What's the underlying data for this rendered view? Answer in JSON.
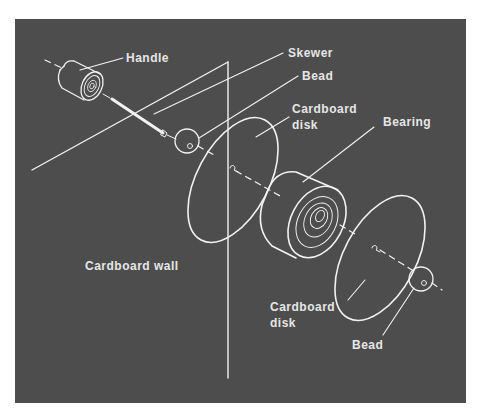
{
  "diagram": {
    "type": "exploded-assembly-illustration",
    "background_color": "#4d4d4d",
    "line_color": "#f2f2f2",
    "text_color": "#e6e6e6",
    "labels": {
      "handle": "Handle",
      "skewer": "Skewer",
      "bead_top": "Bead",
      "disk_top_line1": "Cardboard",
      "disk_top_line2": "disk",
      "bearing": "Bearing",
      "wall": "Cardboard wall",
      "disk_bottom_line1": "Cardboard",
      "disk_bottom_line2": "disk",
      "bead_bottom": "Bead"
    },
    "components": [
      "Handle",
      "Skewer",
      "Bead",
      "Cardboard disk",
      "Bearing",
      "Cardboard disk",
      "Bead",
      "Cardboard wall"
    ]
  }
}
